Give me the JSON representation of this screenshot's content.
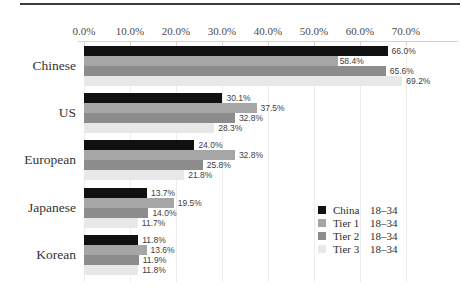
{
  "page": {
    "background": "#ffffff",
    "top_rule_color": "#3d3d3d"
  },
  "chart_data": {
    "type": "bar",
    "orientation": "horizontal",
    "title": "",
    "categories": [
      "Chinese",
      "US",
      "European",
      "Japanese",
      "Korean"
    ],
    "series": [
      {
        "name": "China",
        "range": "18–34",
        "color": "#111111",
        "values": [
          66.0,
          30.1,
          24.0,
          13.7,
          11.8
        ]
      },
      {
        "name": "Tier 1",
        "range": "18–34",
        "color": "#a6a6a6",
        "values": [
          58.4,
          37.5,
          32.8,
          19.5,
          13.6
        ]
      },
      {
        "name": "Tier 2",
        "range": "18–34",
        "color": "#8c8c8c",
        "values": [
          65.6,
          32.8,
          25.8,
          14.0,
          11.9
        ]
      },
      {
        "name": "Tier 3",
        "range": "18–34",
        "color": "#e8e8e8",
        "values": [
          69.2,
          28.3,
          21.8,
          11.7,
          11.8
        ]
      }
    ],
    "value_label_format": "{value}%",
    "x_axis": {
      "min": 0,
      "max": 70,
      "tick_step": 10,
      "ticks": [
        "0.0%",
        "10.0%",
        "20.0%",
        "30.0%",
        "40.0%",
        "50.0%",
        "60.0%",
        "70.0%"
      ],
      "grid": true,
      "position": "top"
    },
    "special_labels": [
      {
        "category": "Chinese",
        "series": "Tier 1",
        "placement": "inside-end-white-bg"
      }
    ],
    "legend": {
      "position": "right-lower",
      "entries_have_two_columns": true
    },
    "colors": {
      "grid": "#ececec",
      "axis": "#d6d2ca",
      "tick_text": "#4a4a4a",
      "category_text": "#333333",
      "value_text": "#404040",
      "legend_text": "#2e2e2e"
    }
  }
}
